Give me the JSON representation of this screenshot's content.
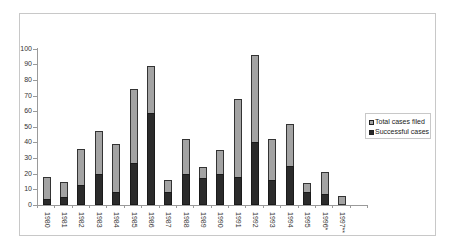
{
  "chart_data": {
    "type": "bar",
    "stacked": "overlay",
    "title": "",
    "xlabel": "",
    "ylabel": "",
    "ylim": [
      0,
      100
    ],
    "yticks": [
      0,
      10,
      20,
      30,
      40,
      50,
      60,
      70,
      80,
      90,
      100
    ],
    "categories": [
      "1980",
      "1981",
      "1982",
      "1983",
      "1984",
      "1985",
      "1986",
      "1987",
      "1988",
      "1989",
      "1990",
      "1991",
      "1992",
      "1993",
      "1994",
      "1995",
      "1996*",
      "1997**"
    ],
    "series": [
      {
        "name": "Total cases filed",
        "color": "#a3a3a3",
        "values": [
          18,
          15,
          36,
          47,
          39,
          74,
          89,
          16,
          42,
          24,
          35,
          68,
          96,
          42,
          52,
          14,
          21,
          6
        ]
      },
      {
        "name": "Successful cases",
        "color": "#2b2b2b",
        "values": [
          4,
          5,
          13,
          20,
          8,
          27,
          59,
          8,
          20,
          17,
          20,
          18,
          40,
          16,
          25,
          8,
          7,
          0
        ]
      }
    ],
    "grid": false,
    "legend_position": "right"
  },
  "legend": {
    "items": [
      {
        "label": "Total cases filed",
        "color": "#a3a3a3"
      },
      {
        "label": "Successful cases",
        "color": "#2b2b2b"
      }
    ]
  }
}
